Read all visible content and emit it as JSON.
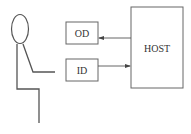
{
  "diagram": {
    "type": "block-diagram",
    "colors": {
      "stroke": "#555555",
      "text": "#333333",
      "background": "#ffffff"
    },
    "nodes": [
      {
        "id": "od",
        "label": "OD"
      },
      {
        "id": "id",
        "label": "ID"
      },
      {
        "id": "host",
        "label": "HOST"
      }
    ],
    "edges": [
      {
        "from": "host",
        "to": "od"
      },
      {
        "from": "id",
        "to": "host"
      }
    ],
    "figure": "seated-person-stick-figure"
  }
}
